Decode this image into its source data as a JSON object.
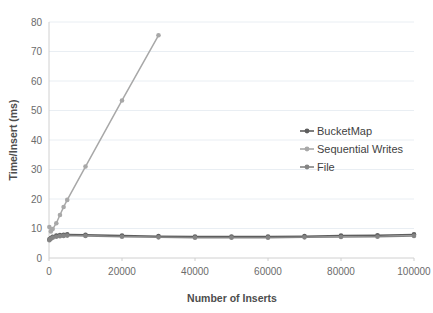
{
  "chart_data": {
    "type": "line",
    "title": "",
    "xlabel": "Number of Inserts",
    "ylabel": "Time/Insert (ms)",
    "xlim": [
      0,
      100000
    ],
    "ylim": [
      0,
      80
    ],
    "xticks": [
      "0",
      "20000",
      "40000",
      "60000",
      "80000",
      "100000"
    ],
    "xtick_values": [
      0,
      20000,
      40000,
      60000,
      80000,
      100000
    ],
    "yticks": [
      "0",
      "10",
      "20",
      "30",
      "40",
      "50",
      "60",
      "70",
      "80"
    ],
    "ytick_values": [
      0,
      10,
      20,
      30,
      40,
      50,
      60,
      70,
      80
    ],
    "grid": true,
    "legend_position": "center-right",
    "series": [
      {
        "name": "BucketMap",
        "color": "#5e5e5e",
        "marker": "circle",
        "x": [
          100,
          500,
          1000,
          2000,
          3000,
          4000,
          5000,
          10000,
          20000,
          30000,
          40000,
          50000,
          60000,
          70000,
          80000,
          90000,
          100000
        ],
        "y": [
          6.3,
          6.8,
          7.2,
          7.6,
          7.8,
          7.9,
          8.0,
          7.9,
          7.6,
          7.4,
          7.3,
          7.3,
          7.3,
          7.4,
          7.6,
          7.7,
          8.0
        ]
      },
      {
        "name": "Sequential Writes",
        "color": "#a8a8a8",
        "marker": "circle",
        "x": [
          100,
          500,
          1000,
          2000,
          3000,
          4000,
          5000,
          10000,
          20000,
          30000
        ],
        "y": [
          10.5,
          9.0,
          9.8,
          11.8,
          14.6,
          17.3,
          19.7,
          31.0,
          53.4,
          75.5
        ]
      },
      {
        "name": "File",
        "color": "#848484",
        "marker": "circle",
        "x": [
          100,
          500,
          1000,
          2000,
          3000,
          4000,
          5000,
          10000,
          20000,
          30000,
          40000,
          50000,
          60000,
          70000,
          80000,
          90000,
          100000
        ],
        "y": [
          6.0,
          6.5,
          6.9,
          7.2,
          7.4,
          7.5,
          7.6,
          7.5,
          7.2,
          7.0,
          6.9,
          6.9,
          6.9,
          7.0,
          7.1,
          7.2,
          7.5
        ]
      }
    ]
  },
  "legend": {
    "items": [
      {
        "label": "BucketMap",
        "color": "#5e5e5e"
      },
      {
        "label": "Sequential Writes",
        "color": "#a8a8a8"
      },
      {
        "label": "File",
        "color": "#848484"
      }
    ]
  },
  "axes": {
    "x_title": "Number of Inserts",
    "y_title": "Time/Insert (ms)"
  }
}
